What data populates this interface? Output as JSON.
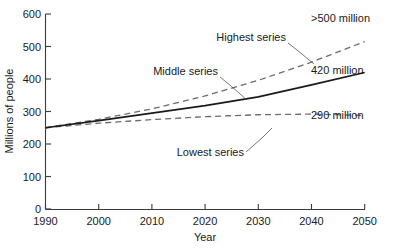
{
  "chart_data": {
    "type": "line",
    "title": "",
    "xlabel": "Year",
    "ylabel": "Millions of people",
    "xlim": [
      1990,
      2050
    ],
    "ylim": [
      0,
      600
    ],
    "grid": false,
    "legend_position": "inline-annotations",
    "x": [
      1990,
      2000,
      2010,
      2020,
      2030,
      2040,
      2050
    ],
    "xticks": [
      "1990",
      "2000",
      "2010",
      "2020",
      "2030",
      "2040",
      "2050"
    ],
    "yticks": [
      "0",
      "100",
      "200",
      "300",
      "400",
      "500",
      "600"
    ],
    "series": [
      {
        "name": "Highest series",
        "style": "dashed",
        "end_label": ">500 million",
        "values": [
          250,
          276,
          308,
          348,
          396,
          452,
          515
        ]
      },
      {
        "name": "Middle series",
        "style": "solid",
        "end_label": "420 million",
        "values": [
          250,
          272,
          295,
          318,
          345,
          382,
          420
        ]
      },
      {
        "name": "Lowest series",
        "style": "dashed",
        "end_label": "290 million",
        "values": [
          250,
          264,
          275,
          284,
          290,
          292,
          288
        ]
      }
    ],
    "annotations": [
      {
        "text": "Highest series",
        "series": "Highest series"
      },
      {
        "text": "Middle series",
        "series": "Middle series"
      },
      {
        "text": "Lowest series",
        "series": "Lowest series"
      },
      {
        "text": ">500 million",
        "series": "Highest series"
      },
      {
        "text": "420 million",
        "series": "Middle series"
      },
      {
        "text": "290 million",
        "series": "Lowest series"
      }
    ],
    "colors": {
      "solid_line": "#1a1a1a",
      "dashed_line": "#6b6b6b",
      "axis": "#3a3a3a",
      "text": "#1a1a1a",
      "background": "#ffffff"
    }
  }
}
